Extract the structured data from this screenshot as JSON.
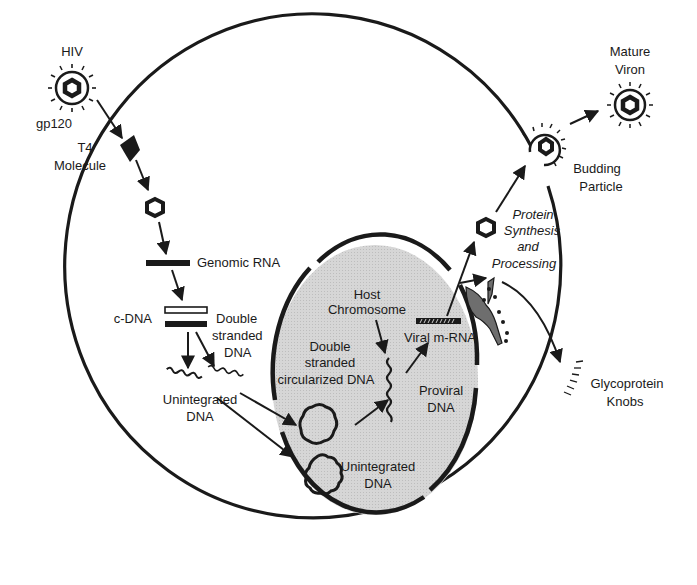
{
  "diagram": {
    "colors": {
      "ink": "#1a1a1a",
      "nucleus_fill": "#d4d4d4",
      "glycoprotein_fill": "#6e6e6e",
      "background": "#ffffff"
    },
    "labels": {
      "hiv": "HIV",
      "gp120": "gp120",
      "t4_line1": "T4",
      "t4_line2": "Molecule",
      "genomic_rna": "Genomic RNA",
      "cdna": "c-DNA",
      "ds_line1": "Double",
      "ds_line2": "stranded",
      "ds_line3": "DNA",
      "unint_out_line1": "Unintegrated",
      "unint_out_line2": "DNA",
      "host_line1": "Host",
      "host_line2": "Chromosome",
      "dscirc_line1": "Double",
      "dscirc_line2": "stranded",
      "dscirc_line3": "circularized DNA",
      "viral_mrna": "Viral m-RNA",
      "proviral_line1": "Proviral",
      "proviral_line2": "DNA",
      "unint_in_line1": "Unintegrated",
      "unint_in_line2": "DNA",
      "protein_line1": "Protein",
      "protein_line2": "Synthesis",
      "protein_line3": "and",
      "protein_line4": "Processing",
      "budding_line1": "Budding",
      "budding_line2": "Particle",
      "mature_line1": "Mature",
      "mature_line2": "Viron",
      "glyco_line1": "Glycoprotein",
      "glyco_line2": "Knobs"
    },
    "nodes": [
      "HIV virion (gp120)",
      "T4 Molecule receptor",
      "Viral core",
      "Genomic RNA",
      "c-DNA / Double stranded DNA",
      "Unintegrated DNA (cytoplasm)",
      "Double stranded circularized DNA",
      "Unintegrated DNA (nucleus)",
      "Host Chromosome / Proviral DNA",
      "Viral m-RNA",
      "Protein Synthesis and Processing",
      "Glycoprotein Knobs",
      "Budding Particle",
      "Mature Viron"
    ]
  }
}
